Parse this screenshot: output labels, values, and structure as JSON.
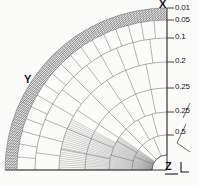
{
  "figure": {
    "type": "axisymmetric-quarter-mesh",
    "background_color": "#fbfbfa",
    "line_color": "#5a5a5a",
    "band_fill_color": "#9a9a9a",
    "text_color": "#16161a"
  },
  "axes": {
    "x": {
      "label": "X",
      "position": "top"
    },
    "y": {
      "label": "Y",
      "position": "left"
    },
    "z": {
      "label": "Z",
      "position": "bottom-right"
    }
  },
  "chart_data": {
    "type": "diagram",
    "title": "",
    "radii_labels": [
      "0.01",
      "0.05",
      "0.1",
      "0.2",
      "0.25",
      "0.25",
      "0.5"
    ],
    "radii_values": [
      0.01,
      0.05,
      0.1,
      0.2,
      0.25,
      0.25,
      0.5
    ],
    "axis_labels": [
      "X",
      "Y",
      "Z"
    ],
    "origin": "bottom-right",
    "quadrant_span_degrees": 90,
    "inner_hole_present": true,
    "outer_band_hatched": true
  },
  "ticks": [
    {
      "text": "0.01"
    },
    {
      "text": "0.05"
    },
    {
      "text": "0.1"
    },
    {
      "text": "0.2"
    },
    {
      "text": "0.25"
    },
    {
      "text": "0.25"
    },
    {
      "text": "0.5"
    }
  ]
}
